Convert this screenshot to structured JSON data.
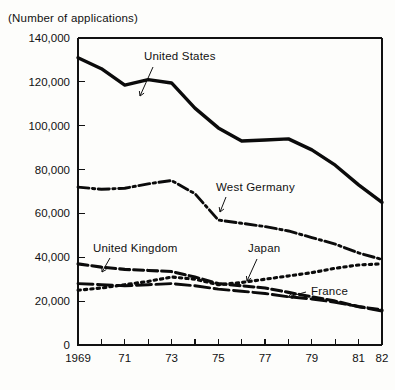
{
  "chart_data": {
    "type": "line",
    "title": "(Number of applications)",
    "xlabel": "",
    "ylabel": "",
    "grid": false,
    "legend_position": "inline-annotations",
    "x": [
      1969,
      1970,
      1971,
      1972,
      1973,
      1974,
      1975,
      1976,
      1977,
      1978,
      1979,
      1980,
      1981,
      1982
    ],
    "xtick_labels": [
      "1969",
      "",
      "71",
      "",
      "73",
      "",
      "75",
      "",
      "77",
      "",
      "79",
      "",
      "81",
      "82"
    ],
    "xlim": [
      1969,
      1982
    ],
    "ylim": [
      0,
      140000
    ],
    "ytick_labels": [
      "0",
      "20,000",
      "40,000",
      "60,000",
      "80,000",
      "100,000",
      "120,000",
      "140,000"
    ],
    "ytick_values": [
      0,
      20000,
      40000,
      60000,
      80000,
      100000,
      120000,
      140000
    ],
    "series": [
      {
        "name": "United States",
        "style": "solid",
        "values": [
          131000,
          126000,
          118500,
          121000,
          119500,
          108000,
          99000,
          93000,
          93500,
          94000,
          89000,
          82000,
          73000,
          65000
        ]
      },
      {
        "name": "West Germany",
        "style": "dash-dot",
        "values": [
          72000,
          71000,
          71500,
          73500,
          75000,
          69000,
          57000,
          55500,
          54000,
          52000,
          49000,
          46000,
          42000,
          39000
        ]
      },
      {
        "name": "United Kingdom",
        "style": "dashed",
        "values": [
          37000,
          35500,
          34500,
          34000,
          33500,
          31000,
          28000,
          27000,
          26000,
          24000,
          22000,
          20000,
          17500,
          16000
        ]
      },
      {
        "name": "Japan",
        "style": "dotted",
        "values": [
          25000,
          26000,
          27500,
          29000,
          31000,
          30000,
          27500,
          28500,
          30000,
          31500,
          33000,
          35000,
          36500,
          37000
        ]
      },
      {
        "name": "France",
        "style": "long-dash",
        "values": [
          28000,
          27500,
          27000,
          27500,
          28000,
          27000,
          25500,
          24500,
          23500,
          22000,
          21000,
          19500,
          17500,
          15500
        ]
      }
    ],
    "annotations": [
      {
        "label": "United States",
        "x_px": 144,
        "y_px": 60
      },
      {
        "label": "West Germany",
        "x_px": 216,
        "y_px": 191
      },
      {
        "label": "United Kingdom",
        "x_px": 93,
        "y_px": 252
      },
      {
        "label": "Japan",
        "x_px": 248,
        "y_px": 252
      },
      {
        "label": "France",
        "x_px": 311,
        "y_px": 295
      }
    ]
  }
}
